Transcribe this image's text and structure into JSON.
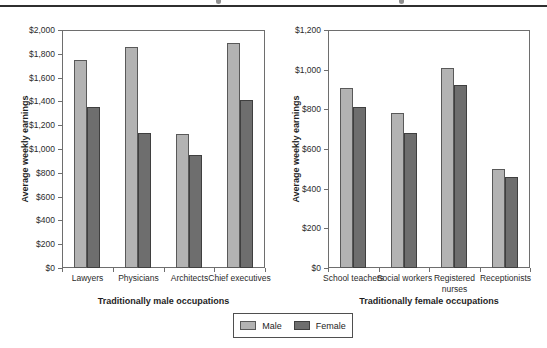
{
  "page": {
    "background": "#ffffff",
    "top_rule_color": "#2f2f2f"
  },
  "bar_colors": {
    "male_fill": "#b3b3b3",
    "male_border": "#595959",
    "female_fill": "#6e6e6e",
    "female_border": "#3f3f3f"
  },
  "legend": {
    "items": [
      {
        "label": "Male",
        "color": "#b3b3b3",
        "border": "#595959"
      },
      {
        "label": "Female",
        "color": "#6e6e6e",
        "border": "#3f3f3f"
      }
    ]
  },
  "chart_data": [
    {
      "type": "bar",
      "title": "",
      "categories": [
        "Lawyers",
        "Physicians",
        "Architects",
        "Chief executives"
      ],
      "series": [
        {
          "name": "Male",
          "values": [
            1750,
            1860,
            1130,
            1890
          ]
        },
        {
          "name": "Female",
          "values": [
            1355,
            1135,
            950,
            1410
          ]
        }
      ],
      "xlabel": "Traditionally male occupations",
      "ylabel": "Average weekly earnings",
      "ylim": [
        0,
        2000
      ],
      "ytick_step": 200,
      "yticklabels": [
        "$0",
        "$200",
        "$400",
        "$600",
        "$800",
        "$1,000",
        "$1,200",
        "$1,400",
        "$1,600",
        "$1,800",
        "$2,000"
      ],
      "grid": false,
      "legend_position": "shared bottom center"
    },
    {
      "type": "bar",
      "title": "",
      "categories": [
        "School teachers",
        "Social workers",
        "Registered nurses",
        "Receptionists"
      ],
      "series": [
        {
          "name": "Male",
          "values": [
            910,
            780,
            1010,
            500
          ]
        },
        {
          "name": "Female",
          "values": [
            810,
            680,
            925,
            460
          ]
        }
      ],
      "xlabel": "Traditionally female occupations",
      "ylabel": "Average weekly earnings",
      "ylim": [
        0,
        1200
      ],
      "ytick_step": 200,
      "yticklabels": [
        "$0",
        "$200",
        "$400",
        "$600",
        "$800",
        "$1,000",
        "$1,200"
      ],
      "grid": false,
      "legend_position": "shared bottom center"
    }
  ]
}
